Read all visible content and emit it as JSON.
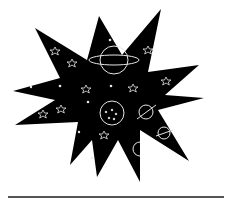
{
  "image": {
    "subject": "space-themed starburst illustration",
    "background_color": "#ffffff",
    "shape_color": "#000000",
    "doodle_color": "#e6e6e6",
    "rule_color": "#555555",
    "elements": [
      "starburst",
      "ringed-planet",
      "dotted-moon",
      "small-planet",
      "stars",
      "sparkles"
    ]
  }
}
